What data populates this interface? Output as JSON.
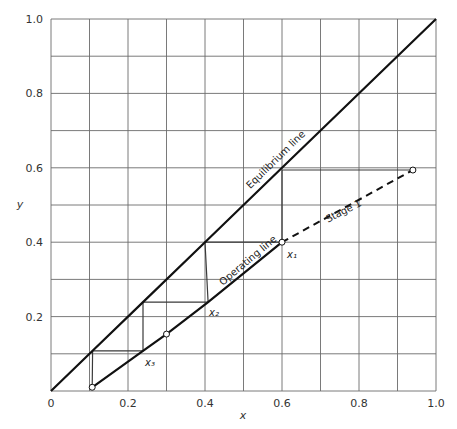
{
  "chart_data": {
    "type": "line",
    "title": "",
    "xlabel": "x",
    "ylabel": "y",
    "xlim": [
      0,
      1.0
    ],
    "ylim": [
      0,
      1.0
    ],
    "grid": true,
    "grid_step": 0.1,
    "xticks": [
      {
        "value": 0,
        "label": "0"
      },
      {
        "value": 0.2,
        "label": "0.2"
      },
      {
        "value": 0.4,
        "label": "0.4"
      },
      {
        "value": 0.6,
        "label": "0.6"
      },
      {
        "value": 0.8,
        "label": "0.8"
      },
      {
        "value": 1.0,
        "label": "1.0"
      }
    ],
    "yticks": [
      {
        "value": 0.2,
        "label": "0.2"
      },
      {
        "value": 0.4,
        "label": "0.4"
      },
      {
        "value": 0.6,
        "label": "0.6"
      },
      {
        "value": 0.8,
        "label": "0.8"
      },
      {
        "value": 1.0,
        "label": "1.0"
      }
    ],
    "series": [
      {
        "name": "Equilibrium line",
        "style": "solid",
        "points": [
          [
            0,
            0
          ],
          [
            0.108,
            0.108
          ],
          [
            0.239,
            0.239
          ],
          [
            0.4,
            0.4
          ],
          [
            0.6,
            0.6
          ],
          [
            1.0,
            1.0
          ]
        ]
      },
      {
        "name": "Operating line",
        "style": "solid",
        "points": [
          [
            0.107,
            0.01
          ],
          [
            0.239,
            0.108
          ],
          [
            0.3,
            0.153
          ],
          [
            0.408,
            0.239
          ],
          [
            0.6,
            0.4
          ]
        ]
      },
      {
        "name": "Stage 1",
        "style": "dashed",
        "points": [
          [
            0.6,
            0.4
          ],
          [
            0.94,
            0.594
          ]
        ]
      },
      {
        "name": "Stages",
        "style": "steps",
        "points": [
          [
            0.94,
            0.594
          ],
          [
            0.6,
            0.594
          ],
          [
            0.6,
            0.4
          ],
          [
            0.4,
            0.4
          ],
          [
            0.408,
            0.239
          ],
          [
            0.239,
            0.239
          ],
          [
            0.239,
            0.108
          ],
          [
            0.108,
            0.108
          ],
          [
            0.107,
            0.01
          ]
        ]
      }
    ],
    "markers": [
      {
        "x": 0.94,
        "y": 0.594
      },
      {
        "x": 0.6,
        "y": 0.4
      },
      {
        "x": 0.3,
        "y": 0.153
      },
      {
        "x": 0.107,
        "y": 0.01
      }
    ],
    "annotations": [
      {
        "text": "Equilibrium line",
        "x": 0.5,
        "y": 0.5,
        "rotate": "along equilibrium line"
      },
      {
        "text": "Operating line",
        "x": 0.5,
        "y": 0.3,
        "rotate": "along operating line"
      },
      {
        "text": "Stage 1",
        "x": 0.77,
        "y": 0.5,
        "rotate": "along dashed line"
      },
      {
        "text": "x₁",
        "x": 0.6,
        "y": 0.4
      },
      {
        "text": "x₂",
        "x": 0.408,
        "y": 0.239
      },
      {
        "text": "x₃",
        "x": 0.239,
        "y": 0.108
      }
    ]
  }
}
